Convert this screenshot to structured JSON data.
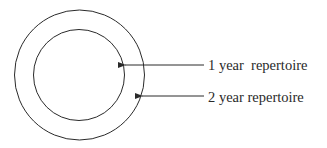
{
  "diagram": {
    "type": "concentric-circles",
    "stroke_color": "#2a2a2a",
    "background": "#ffffff",
    "circles": [
      {
        "name": "outer",
        "cx": 79.5,
        "cy": 75,
        "r": 65
      },
      {
        "name": "inner",
        "cx": 79,
        "cy": 75,
        "r": 45.5
      }
    ],
    "labels": [
      {
        "text": "1 year  repertoire",
        "points_to": "inner",
        "arrow_from_x": 204,
        "arrow_to_x": 125,
        "y": 65,
        "text_x": 208,
        "text_y": 69.5
      },
      {
        "text": "2 year repertoire",
        "points_to": "outer",
        "arrow_from_x": 204,
        "arrow_to_x": 142,
        "y": 96,
        "text_x": 208,
        "text_y": 101.5
      }
    ]
  }
}
